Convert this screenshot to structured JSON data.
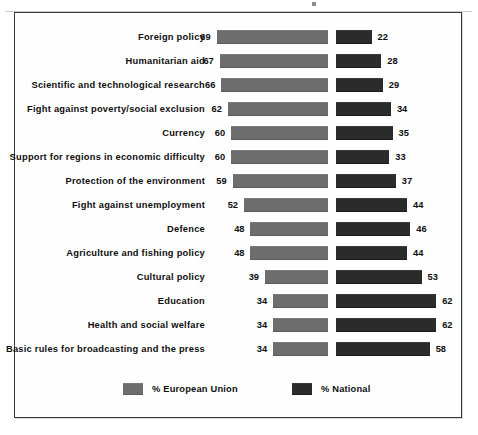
{
  "legend": {
    "eu_label": "% European Union",
    "national_label": "% National"
  },
  "chart_data": {
    "type": "bar",
    "orientation": "horizontal",
    "title": "",
    "subtitle": "",
    "xlabel": "",
    "ylabel": "",
    "grid": false,
    "legend_position": "bottom",
    "value_unit": "%",
    "xlim": [
      0,
      70
    ],
    "categories": [
      "Foreign policy",
      "Humanitarian aid",
      "Scientific and technological research",
      "Fight against poverty/social exclusion",
      "Currency",
      "Support for regions in economic difficulty",
      "Protection of the environment",
      "Fight against unemployment",
      "Defence",
      "Agriculture and fishing policy",
      "Cultural policy",
      "Education",
      "Health and social welfare",
      "Basic rules for broadcasting and the press"
    ],
    "series": [
      {
        "name": "% European Union",
        "color": "#6d6d6d",
        "values": [
          69,
          67,
          66,
          62,
          60,
          60,
          59,
          52,
          48,
          48,
          39,
          34,
          34,
          34
        ]
      },
      {
        "name": "% National",
        "color": "#2b2b2b",
        "values": [
          22,
          28,
          29,
          34,
          35,
          33,
          37,
          44,
          46,
          44,
          53,
          62,
          62,
          58
        ]
      }
    ]
  }
}
